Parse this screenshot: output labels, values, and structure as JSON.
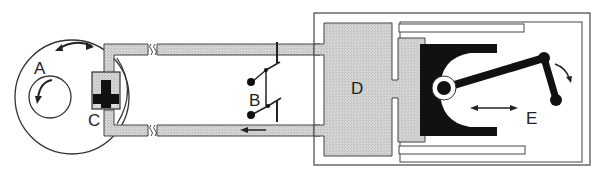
{
  "diagram": {
    "type": "mechanical-schematic",
    "colors": {
      "background": "#ffffff",
      "line": "#333333",
      "fluid_fill": "#cfcfcf",
      "solid_black": "#111111"
    },
    "labels": {
      "A": "A",
      "B": "B",
      "C": "C",
      "D": "D",
      "E": "E"
    },
    "components": [
      {
        "id": "A",
        "description": "rotating disc with inner circle and rotation arrows"
      },
      {
        "id": "B",
        "description": "double switch / contact pair between pipes"
      },
      {
        "id": "C",
        "description": "valve/plunger in chamber beside disc"
      },
      {
        "id": "D",
        "description": "central fluid chamber"
      },
      {
        "id": "E",
        "description": "piston with connecting rod and crank"
      }
    ],
    "arrows": [
      {
        "location": "top of disc A",
        "type": "double-headed curved"
      },
      {
        "location": "inside disc A",
        "type": "curved rotation"
      },
      {
        "location": "bottom pipe",
        "type": "flow arrow pointing left"
      },
      {
        "location": "below piston rod",
        "type": "double-headed horizontal"
      },
      {
        "location": "crank at right",
        "type": "curved rotation"
      }
    ]
  }
}
